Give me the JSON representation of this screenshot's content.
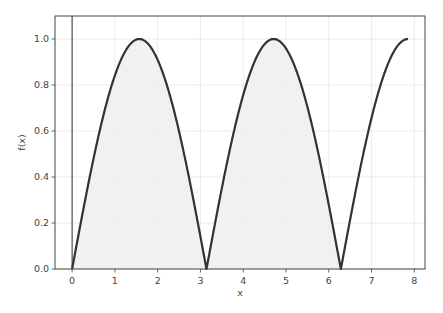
{
  "chart_data": {
    "type": "line",
    "title": "",
    "xlabel": "x",
    "ylabel": "f(x)",
    "xlim": [
      -0.4,
      8.25
    ],
    "ylim": [
      0.0,
      1.1
    ],
    "xticks": [
      0,
      1,
      2,
      3,
      4,
      5,
      6,
      7,
      8
    ],
    "yticks": [
      0.0,
      0.2,
      0.4,
      0.6,
      0.8,
      1.0
    ],
    "xtick_labels": [
      "0",
      "1",
      "2",
      "3",
      "4",
      "5",
      "6",
      "7",
      "8"
    ],
    "ytick_labels": [
      "0.0",
      "0.2",
      "0.4",
      "0.6",
      "0.8",
      "1.0"
    ],
    "grid": true,
    "legend": null,
    "series": [
      {
        "name": "f(x) = |sin(x)|",
        "function": "abs(sin(x))",
        "x_range": [
          0,
          7.854
        ],
        "color": "#333333",
        "x": [
          0,
          0.5,
          1.0,
          1.5708,
          2.0,
          2.5,
          3.1416,
          3.5,
          4.0,
          4.7124,
          5.0,
          5.5,
          6.2832,
          6.5,
          7.0,
          7.5,
          7.854
        ],
        "y": [
          0.0,
          0.479,
          0.841,
          1.0,
          0.909,
          0.598,
          0.0,
          0.351,
          0.757,
          1.0,
          0.959,
          0.706,
          0.0,
          0.215,
          0.657,
          0.938,
          1.0
        ]
      }
    ],
    "fill_between": {
      "x_range": [
        0,
        6.2832
      ],
      "y_from": 0,
      "y_to": "f(x)",
      "color": "#eeeeee"
    },
    "vertical_line": {
      "x": 0,
      "color": "#333333"
    },
    "annotations": []
  },
  "colors": {
    "curve": "#333333",
    "fill": "#efefef",
    "grid": "#dddddd",
    "spine": "#444444",
    "text": "#444444"
  }
}
